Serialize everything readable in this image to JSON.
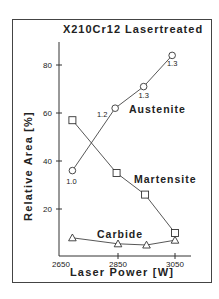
{
  "chart_data": {
    "type": "line",
    "title": "X210Cr12 Lasertreated",
    "xlabel": "Laser Power [W]",
    "ylabel": "Relative Area [%]",
    "xlim": [
      2650,
      3150
    ],
    "ylim": [
      0,
      90
    ],
    "xticks": [
      2650,
      2850,
      3050
    ],
    "yticks": [
      20,
      40,
      60,
      80
    ],
    "grid": false,
    "legend": "inline labels",
    "series": [
      {
        "name": "Austenite",
        "marker": "circle",
        "x": [
          2690,
          2840,
          2940,
          3040
        ],
        "y": [
          36,
          62,
          71,
          84
        ],
        "annotations": [
          "1.0",
          "1.2",
          "1.3",
          "1.3"
        ]
      },
      {
        "name": "Martensite",
        "marker": "square",
        "x": [
          2690,
          2845,
          2945,
          3050
        ],
        "y": [
          57,
          35,
          26,
          10
        ],
        "annotations": []
      },
      {
        "name": "Carbide",
        "marker": "triangle",
        "x": [
          2690,
          2850,
          2950,
          3050
        ],
        "y": [
          8,
          5.5,
          5,
          7
        ],
        "annotations": []
      }
    ]
  }
}
